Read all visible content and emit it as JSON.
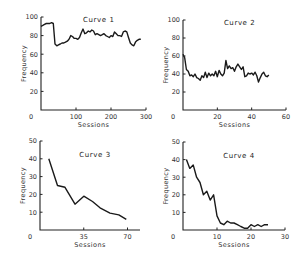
{
  "chart_data": [
    {
      "type": "line",
      "title": "Curve 1",
      "xlabel": "Sessions",
      "ylabel": "Frequency",
      "xlim": [
        0,
        300
      ],
      "ylim": [
        0,
        100
      ],
      "xticks": [
        0,
        100,
        200,
        300
      ],
      "yticks": [
        20,
        40,
        60,
        80,
        100
      ],
      "grid": false,
      "frame": {
        "x0": 41,
        "x1": 146,
        "y0": 110,
        "y1": 17
      },
      "x": [
        0,
        5,
        10,
        15,
        20,
        25,
        30,
        35,
        40,
        45,
        50,
        55,
        60,
        65,
        70,
        75,
        80,
        85,
        90,
        95,
        100,
        105,
        110,
        115,
        120,
        125,
        130,
        135,
        140,
        145,
        150,
        155,
        160,
        165,
        170,
        175,
        180,
        185,
        190,
        195,
        200,
        205,
        210,
        215,
        220,
        225,
        230,
        235,
        240,
        245,
        250,
        255,
        260,
        265,
        270,
        275,
        280,
        285
      ],
      "y": [
        90,
        91,
        92,
        93,
        93,
        93,
        94,
        93,
        71,
        69,
        70,
        71,
        72,
        72,
        73,
        74,
        76,
        80,
        79,
        77,
        77,
        76,
        78,
        83,
        87,
        82,
        83,
        85,
        84,
        86,
        85,
        81,
        82,
        81,
        80,
        81,
        82,
        80,
        79,
        78,
        80,
        79,
        84,
        82,
        80,
        80,
        79,
        84,
        85,
        84,
        78,
        72,
        70,
        69,
        73,
        75,
        76,
        76
      ],
      "series": [
        {
          "name": "Curve 1",
          "values": [
            90,
            91,
            92,
            93,
            93,
            93,
            94,
            93,
            71,
            69,
            70,
            71,
            72,
            72,
            73,
            74,
            76,
            80,
            79,
            77,
            77,
            76,
            78,
            83,
            87,
            82,
            83,
            85,
            84,
            86,
            85,
            81,
            82,
            81,
            80,
            81,
            82,
            80,
            79,
            78,
            80,
            79,
            84,
            82,
            80,
            80,
            79,
            84,
            85,
            84,
            78,
            72,
            70,
            69,
            73,
            75,
            76,
            76
          ]
        }
      ]
    },
    {
      "type": "line",
      "title": "Curve 2",
      "xlabel": "Sessions",
      "ylabel": "Frequency",
      "xlim": [
        0,
        60
      ],
      "ylim": [
        0,
        100
      ],
      "xticks": [
        0,
        20,
        40,
        60
      ],
      "yticks": [
        20,
        40,
        60,
        80,
        100
      ],
      "grid": false,
      "frame": {
        "x0": 183,
        "x1": 286,
        "y0": 110,
        "y1": 20
      },
      "x": [
        0,
        1,
        2,
        3,
        4,
        5,
        6,
        7,
        8,
        9,
        10,
        11,
        12,
        13,
        14,
        15,
        16,
        17,
        18,
        19,
        20,
        21,
        22,
        23,
        24,
        25,
        26,
        27,
        28,
        29,
        30,
        31,
        32,
        33,
        34,
        35,
        36,
        37,
        38,
        39,
        40,
        41,
        42,
        43,
        44,
        45,
        46,
        47,
        48,
        49,
        50
      ],
      "y": [
        62,
        58,
        45,
        43,
        38,
        39,
        37,
        40,
        36,
        35,
        33,
        38,
        36,
        42,
        36,
        41,
        38,
        40,
        38,
        43,
        37,
        44,
        40,
        38,
        41,
        55,
        46,
        49,
        46,
        47,
        43,
        48,
        51,
        48,
        45,
        48,
        37,
        38,
        41,
        40,
        41,
        39,
        42,
        38,
        31,
        36,
        40,
        42,
        38,
        37,
        39
      ],
      "series": [
        {
          "name": "Curve 2",
          "values": [
            62,
            58,
            45,
            43,
            38,
            39,
            37,
            40,
            36,
            35,
            33,
            38,
            36,
            42,
            36,
            41,
            38,
            40,
            38,
            43,
            37,
            44,
            40,
            38,
            41,
            55,
            46,
            49,
            46,
            47,
            43,
            48,
            51,
            48,
            45,
            48,
            37,
            38,
            41,
            40,
            41,
            39,
            42,
            38,
            31,
            36,
            40,
            42,
            38,
            37,
            39
          ]
        }
      ]
    },
    {
      "type": "line",
      "title": "Curve 3",
      "xlabel": "Sessions",
      "ylabel": "Frequency",
      "xlim": [
        0,
        80
      ],
      "ylim": [
        0,
        50
      ],
      "xticks": [
        0,
        35,
        70
      ],
      "yticks": [
        10,
        20,
        30,
        40,
        50
      ],
      "grid": false,
      "frame": {
        "x0": 40,
        "x1": 140,
        "y0": 230,
        "y1": 141
      },
      "x": [
        7,
        14,
        20,
        28,
        35,
        42,
        48,
        56,
        63,
        69
      ],
      "y": [
        40,
        25,
        24,
        14.5,
        19,
        16,
        12.5,
        9.5,
        8.5,
        6
      ],
      "series": [
        {
          "name": "Curve 3",
          "values": [
            40,
            25,
            24,
            14.5,
            19,
            16,
            12.5,
            9.5,
            8.5,
            6
          ]
        }
      ]
    },
    {
      "type": "line",
      "title": "Curve 4",
      "xlabel": "Sessions",
      "ylabel": "Frequency",
      "xlim": [
        0,
        30
      ],
      "ylim": [
        0,
        50
      ],
      "xticks": [
        0,
        10,
        20,
        30
      ],
      "yticks": [
        10,
        20,
        30,
        40,
        50
      ],
      "grid": false,
      "frame": {
        "x0": 183,
        "x1": 285,
        "y0": 230,
        "y1": 142
      },
      "x": [
        1,
        2,
        3,
        4,
        5,
        6,
        7,
        8,
        9,
        10,
        11,
        12,
        13,
        14,
        15,
        16,
        17,
        18,
        19,
        20,
        21,
        22,
        23,
        24,
        25
      ],
      "y": [
        40,
        35,
        37,
        30,
        27,
        20,
        22,
        17,
        20,
        8,
        4,
        3,
        5,
        4,
        4,
        3,
        2,
        1,
        1,
        3,
        2,
        3,
        2,
        3,
        3
      ],
      "series": [
        {
          "name": "Curve 4",
          "values": [
            40,
            35,
            37,
            30,
            27,
            20,
            22,
            17,
            20,
            8,
            4,
            3,
            5,
            4,
            4,
            3,
            2,
            1,
            1,
            3,
            2,
            3,
            2,
            3,
            3
          ]
        }
      ]
    }
  ]
}
